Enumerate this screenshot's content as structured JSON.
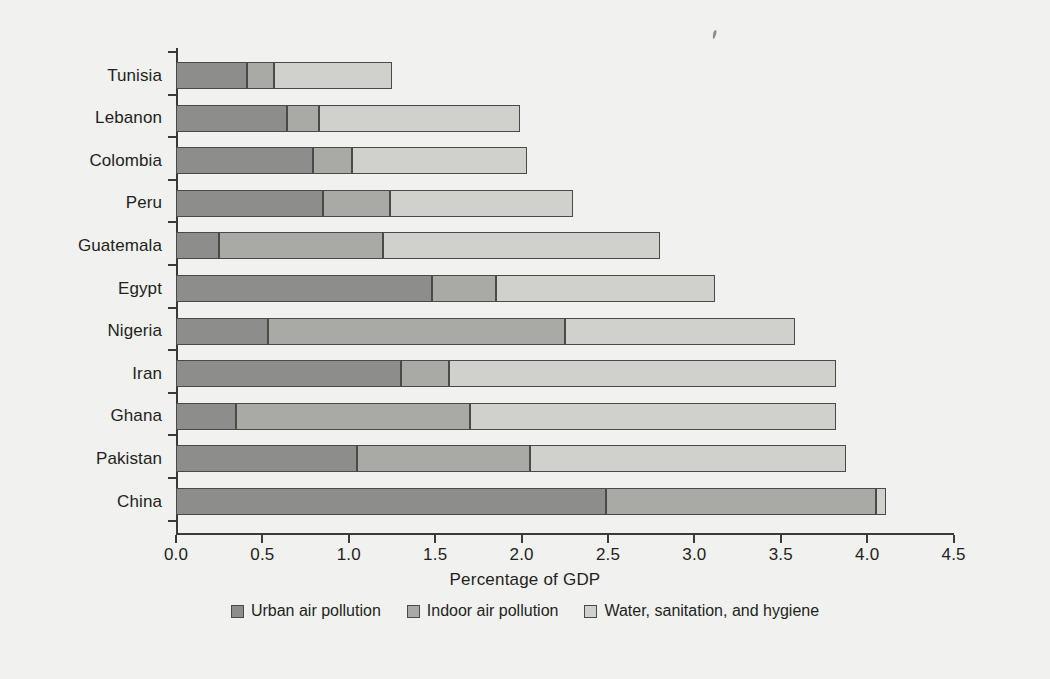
{
  "chart_data": {
    "type": "bar",
    "orientation": "horizontal",
    "stacked": true,
    "title": "",
    "xlabel": "Percentage of GDP",
    "ylabel": "",
    "xlim": [
      0.0,
      4.5
    ],
    "grid": false,
    "legend_position": "bottom",
    "xticks": [
      "0.0",
      "0.5",
      "1.0",
      "1.5",
      "2.0",
      "2.5",
      "3.0",
      "3.5",
      "4.0",
      "4.5"
    ],
    "xtick_values": [
      0.0,
      0.5,
      1.0,
      1.5,
      2.0,
      2.5,
      3.0,
      3.5,
      4.0,
      4.5
    ],
    "categories": [
      "Tunisia",
      "Lebanon",
      "Colombia",
      "Peru",
      "Guatemala",
      "Egypt",
      "Nigeria",
      "Iran",
      "Ghana",
      "Pakistan",
      "China"
    ],
    "series": [
      {
        "name": "Urban air pollution",
        "color": "#8d8d8b",
        "values": [
          0.41,
          0.64,
          0.79,
          0.85,
          0.25,
          1.48,
          0.53,
          1.3,
          0.35,
          1.05,
          2.49
        ]
      },
      {
        "name": "Indoor air pollution",
        "color": "#a9a9a6",
        "values": [
          0.16,
          0.19,
          0.23,
          0.39,
          0.95,
          0.37,
          1.72,
          0.28,
          1.35,
          1.0,
          1.56
        ]
      },
      {
        "name": "Water, sanitation, and hygiene",
        "color": "#d0d0cd",
        "values": [
          0.68,
          1.16,
          1.01,
          1.06,
          1.6,
          1.27,
          1.33,
          2.24,
          2.12,
          1.83,
          0.06
        ]
      }
    ],
    "totals": [
      1.25,
      1.99,
      2.03,
      2.3,
      2.8,
      3.12,
      3.58,
      3.82,
      3.82,
      3.88,
      4.11
    ]
  },
  "colors": {
    "background": "#f1f1ef",
    "axis": "#3a3a38",
    "text": "#231f1d",
    "series_dark": "#8d8d8b",
    "series_medium": "#a9a9a6",
    "series_light": "#d0d0cd",
    "segment_outline": "#4a4a47"
  }
}
